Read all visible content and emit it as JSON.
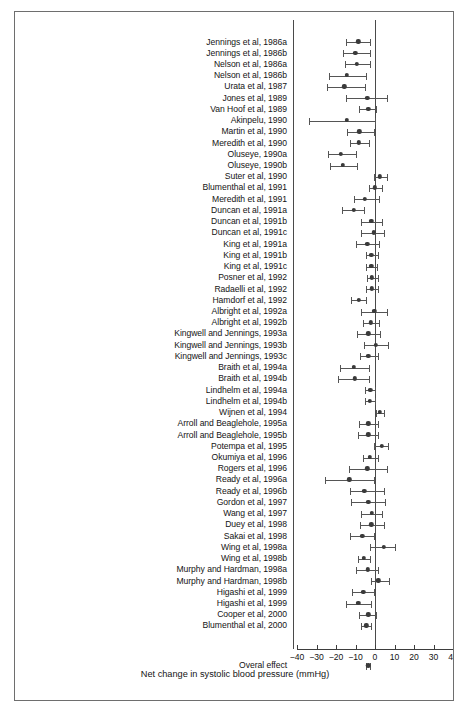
{
  "figure": {
    "xlabel": "Net change in systolic blood pressure (mmHg)",
    "overall_label": "Overal effect"
  },
  "axis": {
    "ticks": [
      "−40",
      "−30",
      "−20",
      "−10",
      "0",
      "10",
      "20",
      "30",
      "40"
    ],
    "tick_values": [
      -40,
      -30,
      -20,
      -10,
      0,
      10,
      20,
      30,
      40
    ],
    "xmin": -40,
    "xmax": 40,
    "reference_line": 0
  },
  "chart_data": {
    "type": "forest",
    "title": "",
    "xlabel": "Net change in systolic blood pressure (mmHg)",
    "ylabel": "",
    "xlim": [
      -40,
      40
    ],
    "grid": false,
    "legend": "none",
    "reference_line": 0,
    "effect_measure": "Net change in systolic blood pressure (mmHg)",
    "studies": [
      {
        "label": "Jennings et al, 1986a",
        "estimate": -8.6,
        "ci_low": -14.8,
        "ci_high": -2.7
      },
      {
        "label": "Jennings et al, 1986b",
        "estimate": -10.2,
        "ci_low": -16.6,
        "ci_high": -2.8
      },
      {
        "label": "Nelson et al, 1986a",
        "estimate": -9.4,
        "ci_low": -15.5,
        "ci_high": -2.8
      },
      {
        "label": "Nelson et al, 1986b",
        "estimate": -14.4,
        "ci_low": -23.8,
        "ci_high": -4.8
      },
      {
        "label": "Urata et al, 1987",
        "estimate": -15.8,
        "ci_low": -24.6,
        "ci_high": -4.9
      },
      {
        "label": "Jones et al, 1989",
        "estimate": -4.0,
        "ci_low": -14.8,
        "ci_high": 6.0
      },
      {
        "label": "Van Hoof et al, 1989",
        "estimate": -3.4,
        "ci_low": -8.2,
        "ci_high": 0.4
      },
      {
        "label": "Akinpelu, 1990",
        "estimate": -14.6,
        "ci_low": -34.0,
        "ci_high": 0.2
      },
      {
        "label": "Martin et al, 1990",
        "estimate": -8.0,
        "ci_low": -14.2,
        "ci_high": -0.4
      },
      {
        "label": "Meredith et al, 1990",
        "estimate": -8.4,
        "ci_low": -12.8,
        "ci_high": -3.0
      },
      {
        "label": "Oluseye, 1990a",
        "estimate": -17.4,
        "ci_low": -24.2,
        "ci_high": -9.6
      },
      {
        "label": "Oluseye, 1990b",
        "estimate": -16.4,
        "ci_low": -23.0,
        "ci_high": -9.2
      },
      {
        "label": "Suter et al, 1990",
        "estimate": 2.4,
        "ci_low": -0.4,
        "ci_high": 6.0
      },
      {
        "label": "Blumenthal et al, 1991",
        "estimate": 0.0,
        "ci_low": -3.2,
        "ci_high": 3.6
      },
      {
        "label": "Meredith et al, 1991",
        "estimate": -5.2,
        "ci_low": -10.6,
        "ci_high": 1.8
      },
      {
        "label": "Duncan et al, 1991a",
        "estimate": -11.0,
        "ci_low": -16.8,
        "ci_high": -5.4
      },
      {
        "label": "Duncan et al, 1991b",
        "estimate": -1.8,
        "ci_low": -7.2,
        "ci_high": 3.4
      },
      {
        "label": "Duncan et al, 1991c",
        "estimate": -0.6,
        "ci_low": -7.2,
        "ci_high": 4.4
      },
      {
        "label": "King et al, 1991a",
        "estimate": -4.0,
        "ci_low": -9.8,
        "ci_high": 2.2
      },
      {
        "label": "King et al, 1991b",
        "estimate": -1.8,
        "ci_low": -4.4,
        "ci_high": 1.4
      },
      {
        "label": "King et al, 1991c",
        "estimate": -1.8,
        "ci_low": -4.6,
        "ci_high": 1.2
      },
      {
        "label": "Posner et al, 1992",
        "estimate": -1.6,
        "ci_low": -4.2,
        "ci_high": 1.6
      },
      {
        "label": "Radaelli et al, 1992",
        "estimate": -1.6,
        "ci_low": -4.6,
        "ci_high": 1.6
      },
      {
        "label": "Hamdorf et al, 1992",
        "estimate": -8.4,
        "ci_low": -12.4,
        "ci_high": -4.4
      },
      {
        "label": "Albright et al, 1992a",
        "estimate": -0.4,
        "ci_low": -7.2,
        "ci_high": 6.2
      },
      {
        "label": "Albright et al, 1992b",
        "estimate": -2.0,
        "ci_low": -6.0,
        "ci_high": 1.8
      },
      {
        "label": "Kingwell and Jennings, 1993a",
        "estimate": -3.4,
        "ci_low": -9.4,
        "ci_high": 2.4
      },
      {
        "label": "Kingwell and Jennings, 1993b",
        "estimate": 0.4,
        "ci_low": -5.6,
        "ci_high": 6.8
      },
      {
        "label": "Kingwell and Jennings, 1993c",
        "estimate": -3.4,
        "ci_low": -7.8,
        "ci_high": 1.4
      },
      {
        "label": "Braith et al, 1994a",
        "estimate": -10.8,
        "ci_low": -17.8,
        "ci_high": -3.2
      },
      {
        "label": "Braith et al, 1994b",
        "estimate": -10.4,
        "ci_low": -19.2,
        "ci_high": -3.2
      },
      {
        "label": "Lindhelm et al, 1994a",
        "estimate": -2.4,
        "ci_low": -5.0,
        "ci_high": 0.2
      },
      {
        "label": "Lindhelm et al, 1994b",
        "estimate": -2.6,
        "ci_low": -5.2,
        "ci_high": -0.2
      },
      {
        "label": "Wijnen et al, 1994",
        "estimate": 2.4,
        "ci_low": 0.4,
        "ci_high": 4.4
      },
      {
        "label": "Arroll and Beaglehole, 1995a",
        "estimate": -3.4,
        "ci_low": -8.2,
        "ci_high": 1.4
      },
      {
        "label": "Arroll and Beaglehole, 1995b",
        "estimate": -3.4,
        "ci_low": -8.6,
        "ci_high": 1.4
      },
      {
        "label": "Potempa et al, 1995",
        "estimate": 3.4,
        "ci_low": -0.4,
        "ci_high": 6.6
      },
      {
        "label": "Okumiya et al, 1996",
        "estimate": -2.6,
        "ci_low": -6.0,
        "ci_high": 1.6
      },
      {
        "label": "Rogers et al, 1996",
        "estimate": -4.0,
        "ci_low": -13.2,
        "ci_high": 6.4
      },
      {
        "label": "Ready et al, 1996a",
        "estimate": -13.2,
        "ci_low": -25.8,
        "ci_high": -0.4
      },
      {
        "label": "Ready et al, 1996b",
        "estimate": -5.4,
        "ci_low": -13.0,
        "ci_high": 4.6
      },
      {
        "label": "Gordon et al, 1997",
        "estimate": -3.4,
        "ci_low": -12.2,
        "ci_high": 5.2
      },
      {
        "label": "Wang et al, 1997",
        "estimate": -1.6,
        "ci_low": -7.0,
        "ci_high": 3.4
      },
      {
        "label": "Duey et al, 1998",
        "estimate": -1.8,
        "ci_low": -7.8,
        "ci_high": 4.4
      },
      {
        "label": "Sakai et al, 1998",
        "estimate": -6.6,
        "ci_low": -12.8,
        "ci_high": -0.4
      },
      {
        "label": "Wing et al, 1998a",
        "estimate": 4.4,
        "ci_low": -2.8,
        "ci_high": 10.4
      },
      {
        "label": "Wing et al, 1998b",
        "estimate": -5.8,
        "ci_low": -8.6,
        "ci_high": -2.4
      },
      {
        "label": "Murphy and Hardman, 1998a",
        "estimate": -3.6,
        "ci_low": -10.0,
        "ci_high": 1.6
      },
      {
        "label": "Murphy and Hardman, 1998b",
        "estimate": 1.6,
        "ci_low": -2.0,
        "ci_high": 7.2
      },
      {
        "label": "Higashi et al, 1999",
        "estimate": -6.0,
        "ci_low": -12.0,
        "ci_high": -0.4
      },
      {
        "label": "Higashi et al, 1999",
        "estimate": -8.6,
        "ci_low": -14.8,
        "ci_high": -2.2
      },
      {
        "label": "Cooper et al, 2000",
        "estimate": -3.4,
        "ci_low": -8.4,
        "ci_high": 0.4
      },
      {
        "label": "Blumenthal et al, 2000",
        "estimate": -4.4,
        "ci_low": -7.4,
        "ci_high": -1.8
      }
    ],
    "overall": {
      "label": "Overal effect",
      "estimate": -3.6,
      "ci_low": -4.8,
      "ci_high": -2.4
    }
  },
  "colors": {
    "marker": "#3a3a3a",
    "line": "#555555",
    "axis": "#3d3d3d",
    "frame": "#6e6e6e",
    "text": "#141414"
  }
}
